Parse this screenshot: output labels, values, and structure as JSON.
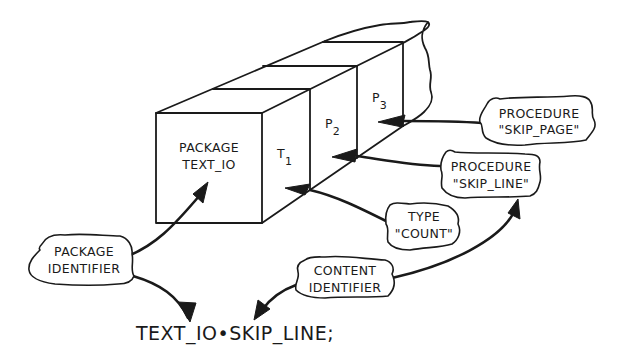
{
  "diagram": {
    "package_box": {
      "line1": "PACKAGE",
      "line2": "TEXT_IO"
    },
    "segments": [
      {
        "name": "T",
        "sub": "1"
      },
      {
        "name": "P",
        "sub": "2"
      },
      {
        "name": "P",
        "sub": "3"
      }
    ],
    "callouts": {
      "skip_page": {
        "line1": "PROCEDURE",
        "line2": "\"SKIP_PAGE\""
      },
      "skip_line": {
        "line1": "PROCEDURE",
        "line2": "\"SKIP_LINE\""
      },
      "type_count": {
        "line1": "TYPE",
        "line2": "\"COUNT\""
      },
      "package_identifier": {
        "line1": "PACKAGE",
        "line2": "IDENTIFIER"
      },
      "content_identifier": {
        "line1": "CONTENT",
        "line2": "IDENTIFIER"
      }
    },
    "statement": "TEXT_IO•SKIP_LINE;",
    "colors": {
      "ink": "#1a1a1a",
      "background": "#ffffff"
    }
  }
}
